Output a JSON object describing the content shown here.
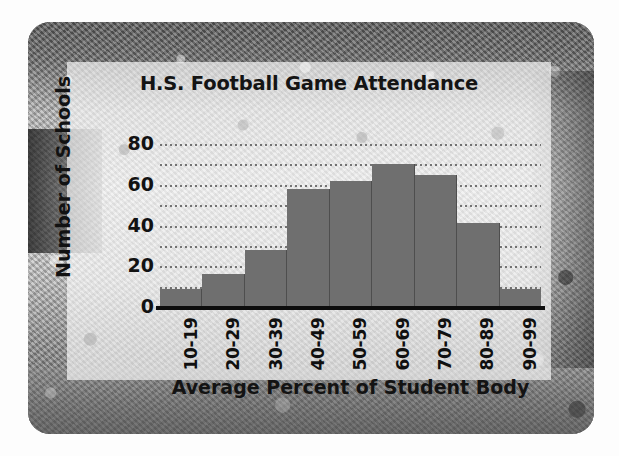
{
  "chart_data": {
    "type": "bar",
    "title": "H.S. Football Game Attendance",
    "xlabel": "Average Percent of Student Body",
    "ylabel": "Number of Schools",
    "categories": [
      "10-19",
      "20-29",
      "30-39",
      "40-49",
      "50-59",
      "60-69",
      "70-79",
      "80-89",
      "90-99"
    ],
    "values": [
      9,
      16,
      28,
      58,
      62,
      70,
      65,
      41,
      9
    ],
    "ylim": [
      0,
      80
    ],
    "y_ticks": [
      0,
      20,
      40,
      60,
      80
    ],
    "y_tick_labels": [
      "0",
      "20",
      "40",
      "60",
      "80"
    ],
    "gridlines": [
      10,
      20,
      30,
      40,
      50,
      60,
      70,
      80
    ],
    "grid": true,
    "grid_style": "dotted-horizontal",
    "legend": null,
    "bar_color": "#6f6f6f",
    "axis_color": "#0d0d0d",
    "text_color": "#121212",
    "x_tick_rotation": -90
  },
  "card": {
    "background_image": "stadium-crowd-photo-grayscale",
    "panel_background": "rgba(252,252,252,0.66)"
  }
}
